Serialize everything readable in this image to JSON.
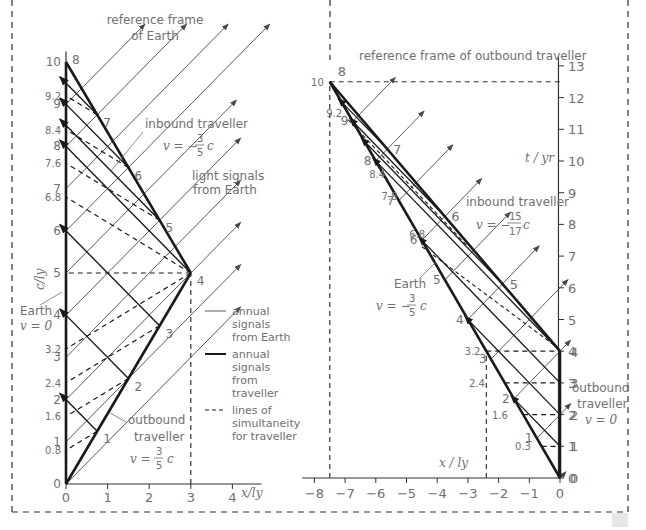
{
  "colors": {
    "world_line": "#1a1a1a",
    "signal": "#5a5a5a",
    "text": "#707070",
    "border": "#333333"
  },
  "left_panel": {
    "title_line1": "reference frame",
    "title_line2": "of Earth",
    "y_axis_label": "c/ly",
    "x_axis_label": "x/ly",
    "x_ticks": [
      "0",
      "1",
      "2",
      "3",
      "4"
    ],
    "y_ticks": [
      "0",
      "0.8",
      "1",
      "1.6",
      "2",
      "2.4",
      "3",
      "3.2",
      "4",
      "5",
      "6",
      "6.8",
      "7",
      "7.6",
      "8",
      "8.4",
      "9",
      "9.2",
      "10"
    ],
    "traveller_ticks": [
      "1",
      "2",
      "3",
      "4",
      "5",
      "6",
      "7",
      "8"
    ],
    "labels": {
      "inbound_traveller": "inbound traveller",
      "inbound_velocity": "v = −3/5 c",
      "light_signals": "light signals",
      "from_earth": "from Earth",
      "earth": "Earth",
      "earth_velocity": "v = 0",
      "outbound_traveller": "outbound",
      "outbound_traveller2": "traveller",
      "outbound_velocity": "v = 3/5 c"
    },
    "legend": [
      {
        "style": "thin",
        "lines": [
          "annual",
          "signals",
          "from Earth"
        ]
      },
      {
        "style": "thick",
        "lines": [
          "annual",
          "signals",
          "from",
          "traveller"
        ]
      },
      {
        "style": "dashed",
        "lines": [
          "lines of",
          "simultaneity",
          "for traveller"
        ]
      }
    ]
  },
  "right_panel": {
    "title": "reference frame of outbound traveller",
    "y_axis_label": "t / yr",
    "x_axis_label": "x / ly",
    "x_ticks": [
      "−8",
      "−7",
      "−6",
      "−5",
      "−4",
      "−3",
      "−2",
      "−1",
      "0"
    ],
    "y_ticks": [
      "0",
      "1",
      "2",
      "3",
      "4",
      "5",
      "6",
      "7",
      "8",
      "9",
      "10",
      "11",
      "12",
      "13"
    ],
    "earth_ticks": [
      "0.3",
      "1.6",
      "2.4",
      "3.2",
      "6.8",
      "7.8",
      "8.4",
      "9.2",
      "10"
    ],
    "labels": {
      "inbound_traveller": "inbound traveller",
      "inbound_velocity": "v = −15/17 c",
      "earth": "Earth",
      "earth_velocity": "v = −3/5 c",
      "outbound_traveller": "outbound",
      "outbound_traveller2": "traveller",
      "outbound_velocity": "v = 0"
    }
  },
  "chart_data": [
    {
      "type": "line",
      "title": "reference frame of Earth",
      "xlabel": "x/ly",
      "ylabel": "c/ly",
      "xlim": [
        0,
        4
      ],
      "ylim": [
        0,
        10
      ],
      "series": [
        {
          "name": "Earth v=0",
          "x": [
            0,
            0
          ],
          "y": [
            0,
            10
          ]
        },
        {
          "name": "outbound traveller v=3/5c",
          "x": [
            0,
            3
          ],
          "y": [
            0,
            5
          ]
        },
        {
          "name": "inbound traveller v=-3/5c",
          "x": [
            3,
            0
          ],
          "y": [
            5,
            10
          ]
        }
      ],
      "simultaneity_earth_times": [
        0.8,
        1.6,
        2.4,
        3.2,
        5,
        6.8,
        7.6,
        8.4,
        9.2
      ],
      "traveller_tick_labels": [
        1,
        2,
        3,
        4,
        5,
        6,
        7,
        8
      ],
      "vertical_dashed_x": 3
    },
    {
      "type": "line",
      "title": "reference frame of outbound traveller",
      "xlabel": "x / ly",
      "ylabel": "t / yr",
      "xlim": [
        -8,
        0
      ],
      "ylim": [
        0,
        13
      ],
      "series": [
        {
          "name": "outbound traveller v=0",
          "x": [
            0,
            0
          ],
          "y": [
            0,
            4
          ]
        },
        {
          "name": "inbound traveller v=-15/17c",
          "x": [
            0,
            -7.5
          ],
          "y": [
            4,
            12.5
          ]
        },
        {
          "name": "Earth v=-3/5c",
          "x": [
            0,
            -7.5
          ],
          "y": [
            0,
            12.5
          ]
        }
      ],
      "horizontal_dashed_t": [
        1,
        2,
        3,
        4,
        12.5
      ],
      "vertical_dashed_x": [
        -7.5,
        -2.4
      ]
    }
  ]
}
